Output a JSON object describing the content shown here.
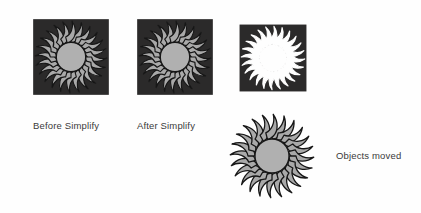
{
  "figure": {
    "background_color": "#ffffff"
  },
  "colors": {
    "square_dark": "#2b2a2a",
    "sun_fill": "#a9a9a9",
    "sun_center": "#b0b0b0",
    "sun_outline": "#1a1a1a",
    "knockout_fill": "#ffffff",
    "label_text": "#3a3a3a"
  },
  "graphics": [
    {
      "name": "sun-on-dark-square-before",
      "description": "Gray sunburst with 24 swirled rays layered over a dark square",
      "has_square": true,
      "sun_fill": "#a9a9a9",
      "square_fill": "#2b2a2a",
      "ray_count": 24,
      "swirl": "clockwise"
    },
    {
      "name": "sun-on-dark-square-after",
      "description": "Gray sunburst with 24 swirled rays layered over a dark square",
      "has_square": true,
      "sun_fill": "#a9a9a9",
      "square_fill": "#2b2a2a",
      "ray_count": 24,
      "swirl": "clockwise"
    },
    {
      "name": "sun-knockout-square",
      "description": "Dark square with the sunburst knocked out in white",
      "has_square": true,
      "sun_fill": "#ffffff",
      "square_fill": "#2b2a2a",
      "ray_count": 24,
      "swirl": "clockwise"
    },
    {
      "name": "sun-standalone",
      "description": "Gray sunburst with black outline, no square backdrop",
      "has_square": false,
      "sun_fill": "#a9a9a9",
      "square_fill": null,
      "ray_count": 24,
      "swirl": "clockwise"
    }
  ],
  "labels": {
    "before": "Before Simplify",
    "after": "After Simplify",
    "moved": "Objects moved"
  }
}
